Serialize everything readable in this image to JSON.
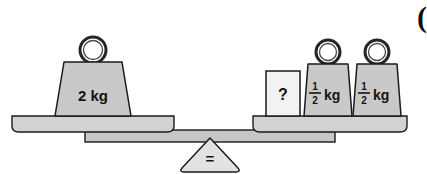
{
  "figure": {
    "name": "balance-scale-diagram",
    "background_color": "#ffffff",
    "outline_color": "#1a1a1a",
    "weight_fill": "#c9c9c9",
    "pan_fill": "#d2d2d2",
    "beam_fill": "#c6c6c6",
    "box_fill": "#f2f2f2",
    "fulcrum_fill": "#e2e2e2"
  },
  "left_pan": {
    "label": "left-pan",
    "weights": [
      {
        "id": "weight-2kg",
        "value_text": "2 kg",
        "has_ring": true
      }
    ]
  },
  "right_pan": {
    "label": "right-pan",
    "items": [
      {
        "id": "unknown-box",
        "value_text": "?",
        "has_ring": false
      },
      {
        "id": "weight-half-kg-1",
        "numerator": "1",
        "denominator": "2",
        "unit": "kg",
        "has_ring": true
      },
      {
        "id": "weight-half-kg-2",
        "numerator": "1",
        "denominator": "2",
        "unit": "kg",
        "has_ring": true
      }
    ]
  },
  "fulcrum": {
    "label": "fulcrum-triangle",
    "symbol": "="
  },
  "corner_mark": {
    "label": "cropped-glyph",
    "text": "("
  }
}
